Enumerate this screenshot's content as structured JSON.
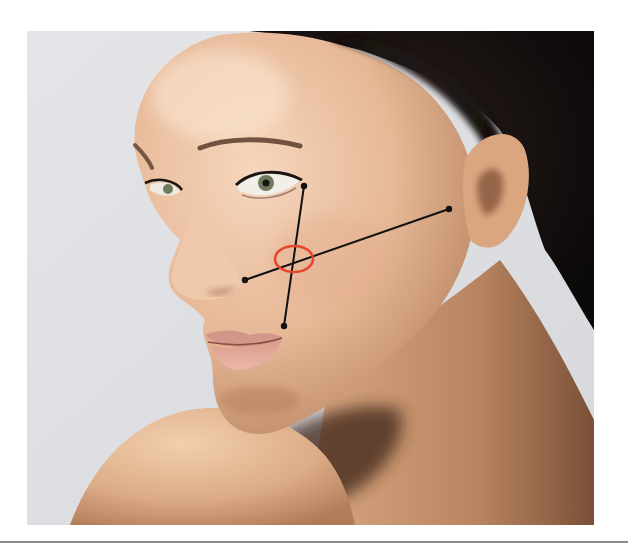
{
  "image": {
    "description": "Portrait photograph of a woman's face in three-quarter view with facial landmark lines drawn on the cheek",
    "frame": {
      "x": 27,
      "y": 31,
      "width": 567,
      "height": 494
    },
    "background_color": "#dfe1e5",
    "skin_color": "#e7bb9c",
    "hair_color": "#141010"
  },
  "annotation": {
    "line_color": "#111111",
    "highlight_color": "#e8452c",
    "points": [
      {
        "name": "lateral-canthus",
        "x": 304,
        "y": 186
      },
      {
        "name": "oral-commissure",
        "x": 284,
        "y": 326
      },
      {
        "name": "nasal-ala",
        "x": 245,
        "y": 280
      },
      {
        "name": "tragus",
        "x": 449,
        "y": 209
      }
    ],
    "lines": [
      {
        "name": "canthus-to-commissure",
        "from": 0,
        "to": 1
      },
      {
        "name": "ala-to-tragus",
        "from": 2,
        "to": 3
      }
    ],
    "intersection_marker": {
      "shape": "ellipse",
      "cx": 294,
      "cy": 259,
      "rx": 19,
      "ry": 13
    }
  },
  "divider": {
    "y": 542,
    "color": "#8a8a8a"
  }
}
